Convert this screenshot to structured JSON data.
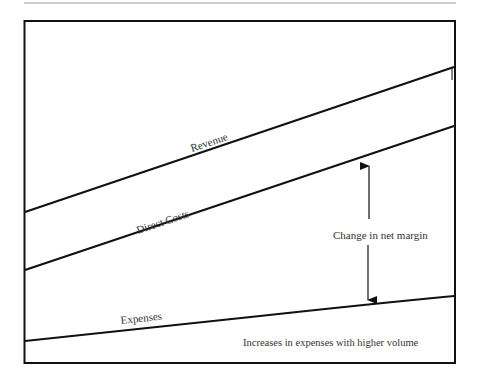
{
  "diagram": {
    "type": "line-diagram",
    "lines": [
      {
        "name": "Revenue",
        "label": "Revenue",
        "x1": 24,
        "y1": 212,
        "x2": 454,
        "y2": 67
      },
      {
        "name": "Direct Costs",
        "label": "Direct Costs",
        "x1": 24,
        "y1": 270,
        "x2": 454,
        "y2": 126
      },
      {
        "name": "Expenses",
        "label": "Expenses",
        "x1": 24,
        "y1": 341,
        "x2": 454,
        "y2": 296
      }
    ],
    "annotations": {
      "net_margin": "Change in net margin",
      "expense_note": "Increases in expenses with higher volume"
    },
    "colors": {
      "line": "#111111",
      "text": "#333333",
      "rule": "#999999"
    }
  }
}
